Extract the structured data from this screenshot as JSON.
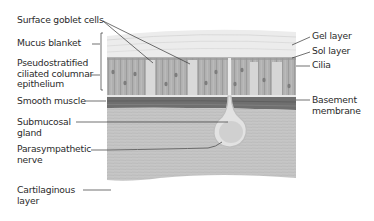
{
  "diagram": {
    "type": "anatomical cross-section",
    "left_labels": [
      {
        "id": "surface-goblet-cells",
        "lines": [
          "Surface goblet cells"
        ]
      },
      {
        "id": "mucus-blanket",
        "lines": [
          "Mucus blanket"
        ]
      },
      {
        "id": "pseudostratified-epithelium",
        "lines": [
          "Pseudostratified",
          "ciliated columnar",
          "epithelium"
        ]
      },
      {
        "id": "smooth-muscle",
        "lines": [
          "Smooth muscle"
        ]
      },
      {
        "id": "submucosal-gland",
        "lines": [
          "Submucosal",
          "gland"
        ]
      },
      {
        "id": "parasympathetic-nerve",
        "lines": [
          "Parasympathetic",
          "nerve"
        ]
      },
      {
        "id": "cartilaginous-layer",
        "lines": [
          "Cartilaginous",
          "layer"
        ]
      }
    ],
    "right_labels": [
      {
        "id": "gel-layer",
        "lines": [
          "Gel layer"
        ]
      },
      {
        "id": "sol-layer",
        "lines": [
          "Sol layer"
        ]
      },
      {
        "id": "cilia",
        "lines": [
          "Cilia"
        ]
      },
      {
        "id": "basement-membrane",
        "lines": [
          "Basement",
          "membrane"
        ]
      }
    ],
    "colors": {
      "mucus": "#e9e9e9",
      "epithelium": "#a9a9a9",
      "smooth_muscle": "#6e6e6e",
      "submucosa": "#c4c4c4",
      "leader_lines": "#333333"
    }
  }
}
